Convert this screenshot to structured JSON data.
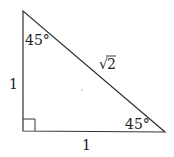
{
  "diagram": {
    "type": "right-triangle",
    "colors": {
      "stroke": "#333333",
      "text": "#222222",
      "background": "#ffffff"
    },
    "vertices": {
      "top": [
        23,
        11
      ],
      "bottom_left": [
        23,
        131
      ],
      "bottom_right": [
        165,
        132
      ]
    },
    "labels": {
      "top_angle": "45°",
      "bottom_right_angle": "45°",
      "left_side": "1",
      "bottom_side": "1",
      "hypotenuse_radical": "√",
      "hypotenuse_value": "2"
    },
    "right_angle_marker": true
  }
}
